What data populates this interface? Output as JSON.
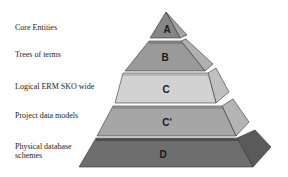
{
  "diagram": {
    "type": "pyramid",
    "levels": [
      {
        "id": "A",
        "label": "Core Entities",
        "letter": "A",
        "front_color": "#8a8a8a",
        "side_color": "#a0a0a0"
      },
      {
        "id": "B",
        "label": "Trees of terms",
        "letter": "B",
        "front_color": "#9a9a9a",
        "side_color": "#b2b2b2"
      },
      {
        "id": "C",
        "label": "Logical ERM SKO wide",
        "letter": "C",
        "front_color": "#d0d0d0",
        "side_color": "#c2c2c2"
      },
      {
        "id": "Cprime",
        "label": "Project data models",
        "letter": "C'",
        "front_color": "#a8a8a8",
        "side_color": "#b6b6b6"
      },
      {
        "id": "D",
        "label": "Physical database schemes",
        "label_line1": "Physical database",
        "label_line2": "schemes",
        "letter": "D",
        "front_color": "#6e6e6e",
        "side_color": "#5e5e5e"
      }
    ]
  }
}
